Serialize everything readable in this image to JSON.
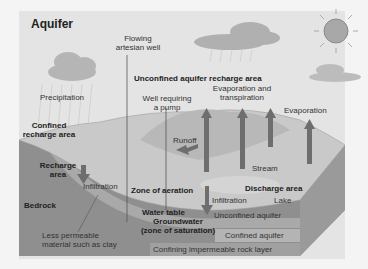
{
  "title": "Aquifer",
  "labels": {
    "flowing_well_1": "Flowing",
    "flowing_well_2": "artesian well",
    "unconfined_recharge": "Unconfined aquifer recharge area",
    "precipitation": "Precipitation",
    "well_pump_1": "Well requiring",
    "well_pump_2": "a pump",
    "evap_trans_1": "Evaporation and",
    "evap_trans_2": "transpiration",
    "evaporation": "Evaporation",
    "confined_recharge_1": "Confined",
    "confined_recharge_2": "recharge area",
    "runoff": "Runoff",
    "recharge_1": "Recharge",
    "recharge_2": "area",
    "stream": "Stream",
    "infiltration_left": "Infiltration",
    "zone_aeration": "Zone of aeration",
    "discharge_area": "Discharge area",
    "infiltration_right": "Infiltration",
    "lake": "Lake",
    "bedrock": "Bedrock",
    "water_table": "Water table",
    "unconfined_aquifer": "Unconfined aquifer",
    "groundwater_1": "Groundwater",
    "groundwater_2": "(zone of saturation)",
    "less_permeable_1": "Less permeable",
    "less_permeable_2": "material such as clay",
    "confined_aquifer": "Confined aquifer",
    "confining_layer": "Confining impermeable rock layer"
  },
  "colors": {
    "frame_bg": "#e4e4e4",
    "surface": "#c9c9c9",
    "aquifer_band": "#a9a9a9",
    "bedrock": "#8f8f8f",
    "arrow": "#6e6e6e",
    "sun": "#a8a8a8",
    "text": "#333333"
  }
}
